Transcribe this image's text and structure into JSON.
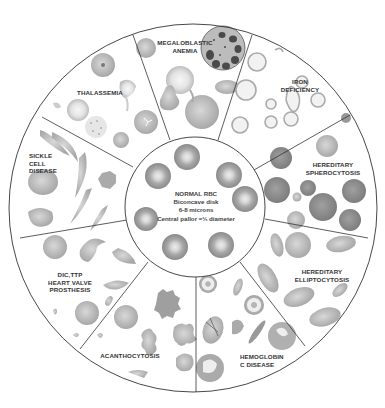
{
  "diagram": {
    "type": "circular-wheel",
    "center": {
      "title": "NORMAL RBC",
      "lines": [
        "Biconcave disk",
        "6-8 microns",
        "Central pallor ≈⅓ diameter"
      ]
    },
    "segments": [
      {
        "id": "megaloblastic",
        "label": "MEGALOBLASTIC\nANEMIA"
      },
      {
        "id": "iron",
        "label": "IRON\nDEFICIENCY"
      },
      {
        "id": "spherocytosis",
        "label": "HEREDITARY\nSPHEROCYTOSIS"
      },
      {
        "id": "elliptocytosis",
        "label": "HEREDITARY\nELLIPTOCYTOSIS"
      },
      {
        "id": "hbc",
        "label": "HEMOGLOBIN\nC DISEASE"
      },
      {
        "id": "acanthocytosis",
        "label": "ACANTHOCYTOSIS"
      },
      {
        "id": "dic",
        "label": "DIC,TTP\nHEART VALVE\nPROSTHESIS"
      },
      {
        "id": "sickle",
        "label": "SICKLE\nCELL\nDISEASE"
      },
      {
        "id": "thalassemia",
        "label": "THALASSEMIA"
      }
    ],
    "colors": {
      "line": "#333333",
      "cell": "#b5b5b5",
      "cell_dark": "#8e8e8e",
      "pallor": "#e2e2e2",
      "background": "#ffffff"
    }
  }
}
